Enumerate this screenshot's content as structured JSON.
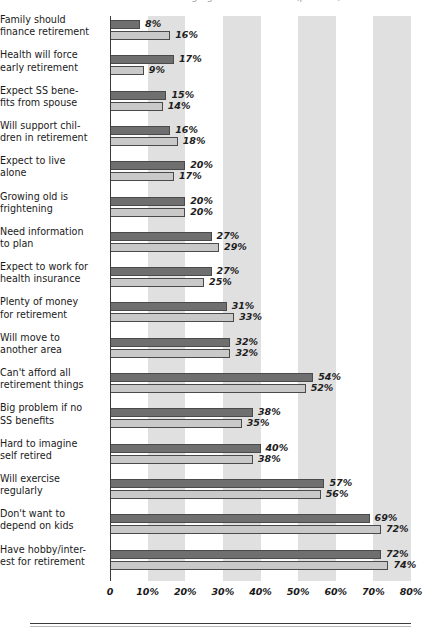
{
  "title": {
    "text": "Attitudes Toward Aging and Retirement (percent)"
  },
  "chart_data": {
    "type": "bar",
    "orientation": "horizontal",
    "title": "Attitudes Toward Aging and Retirement (percent)",
    "xlabel": "",
    "ylabel": "",
    "xlim": [
      0,
      80
    ],
    "xticks": [
      0,
      10,
      20,
      30,
      40,
      50,
      60,
      70,
      80
    ],
    "xticklabels": [
      "0",
      "10%",
      "20%",
      "30%",
      "40%",
      "50%",
      "60%",
      "70%",
      "80%"
    ],
    "grid": false,
    "shaded_bands": [
      [
        10,
        20
      ],
      [
        30,
        40
      ],
      [
        50,
        60
      ],
      [
        70,
        80
      ]
    ],
    "legend": "none",
    "value_label_suffix": "%",
    "series": [
      {
        "name": "series-1",
        "color": "#6f6f6f",
        "values": [
          8,
          17,
          15,
          16,
          20,
          20,
          27,
          27,
          31,
          32,
          54,
          38,
          40,
          57,
          69,
          72
        ]
      },
      {
        "name": "series-2",
        "color": "#c9c9c9",
        "values": [
          16,
          9,
          14,
          18,
          17,
          20,
          29,
          25,
          33,
          32,
          52,
          35,
          38,
          56,
          72,
          74
        ]
      }
    ],
    "categories": [
      "Family should\nfinance retirement",
      "Health will force\nearly retirement",
      "Expect SS bene-\nfits from spouse",
      "Will support chil-\ndren in retirement",
      "Expect to live\nalone",
      "Growing old is\nfrightening",
      "Need information\nto plan",
      "Expect to work for\nhealth insurance",
      "Plenty of money\nfor retirement",
      "Will move to\nanother area",
      "Can't afford all\nretirement things",
      "Big problem if no\nSS benefits",
      "Hard to imagine\nself retired",
      "Will exercise\nregularly",
      "Don't want to\ndepend on kids",
      "Have hobby/inter-\nest for retirement"
    ],
    "value_labels": [
      [
        "8%",
        "16%"
      ],
      [
        "17%",
        "9%"
      ],
      [
        "15%",
        "14%"
      ],
      [
        "16%",
        "18%"
      ],
      [
        "20%",
        "17%"
      ],
      [
        "20%",
        "20%"
      ],
      [
        "27%",
        "29%"
      ],
      [
        "27%",
        "25%"
      ],
      [
        "31%",
        "33%"
      ],
      [
        "32%",
        "32%"
      ],
      [
        "54%",
        "52%"
      ],
      [
        "38%",
        "35%"
      ],
      [
        "40%",
        "38%"
      ],
      [
        "57%",
        "56%"
      ],
      [
        "69%",
        "72%"
      ],
      [
        "72%",
        "74%"
      ]
    ]
  },
  "colors": {
    "series1": "#6f6f6f",
    "series2": "#c9c9c9",
    "band": "#d4d4d4",
    "axis": "#3a3a3a",
    "text": "#1a1a1a"
  }
}
